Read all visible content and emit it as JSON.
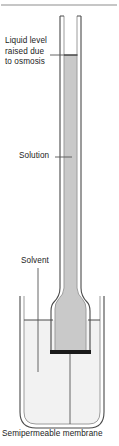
{
  "figure": {
    "type": "science-apparatus-diagram",
    "width": 119,
    "height": 446
  },
  "labels": {
    "liquid_level": "Liquid level raised due to osmosis",
    "solution": "Solution",
    "solvent": "Solvent",
    "membrane": "Semipermeable membrane"
  },
  "colors": {
    "outline": "#3c3c3c",
    "solution_fill": "#c9c9c9",
    "solvent_fill": "#f2f2f2",
    "glass_wall": "#b5b5b5",
    "membrane": "#1a1a1a",
    "text": "#1c1c1c",
    "rule": "#9a9a9a",
    "leader": "#555555"
  },
  "parts": {
    "top_rule": "horizontal-divider-rule",
    "tube": "vertical-capillary-tube",
    "funnel": "flared-funnel-bulb",
    "beaker": "outer-beaker",
    "membrane_band": "semipermeable-membrane-band",
    "liquid_level_line": "solution-meniscus-line",
    "solvent_level_line": "solvent-surface-line"
  }
}
